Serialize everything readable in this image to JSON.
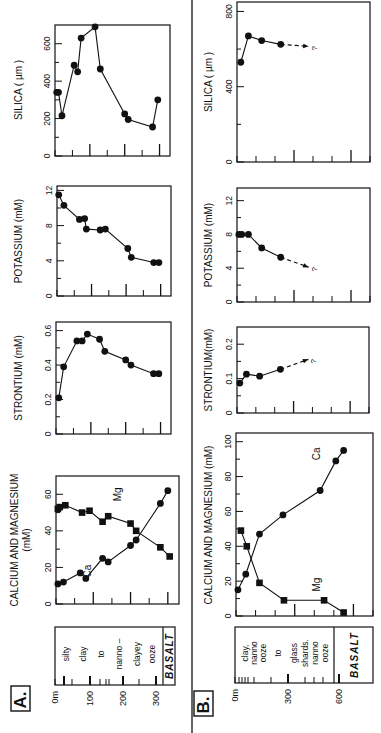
{
  "figure": {
    "panel_a_label": "A.",
    "panel_b_label": "B.",
    "unknown_marker": "?"
  },
  "panel_a": {
    "lithology": {
      "depth_ticks": [
        "0m",
        "100",
        "200",
        "300"
      ],
      "words": [
        "silty",
        "clay",
        "to",
        "nanno –",
        "clayey",
        "ooze"
      ],
      "basalt": "BASALT"
    }
  },
  "panel_b": {
    "lithology": {
      "depth_ticks": [
        "0m",
        "300",
        "600"
      ],
      "words": [
        "clay,",
        "nanno",
        "ooze",
        "to",
        "glass",
        "shards.",
        "nanno",
        "ooze"
      ],
      "basalt": "BASALT"
    }
  },
  "chart_data": [
    {
      "panel": "A",
      "type": "line",
      "title": "SILICA ( µm )",
      "ylabel": "SILICA ( µm )",
      "xlabel": "Depth (m)",
      "ylim": [
        0,
        700
      ],
      "yticks": [
        "0",
        "200",
        "400",
        "600"
      ],
      "xlim": [
        0,
        330
      ],
      "x": [
        5,
        10,
        20,
        55,
        65,
        75,
        115,
        130,
        200,
        210,
        280,
        295
      ],
      "values": [
        340,
        340,
        215,
        485,
        450,
        630,
        690,
        465,
        225,
        195,
        155,
        300
      ]
    },
    {
      "panel": "A",
      "type": "line",
      "title": "POTASSIUM (mM)",
      "ylabel": "POTASSIUM (mM)",
      "xlabel": "Depth (m)",
      "ylim": [
        0,
        12.5
      ],
      "yticks": [
        "0",
        "4",
        "8",
        "12"
      ],
      "xlim": [
        0,
        330
      ],
      "x": [
        5,
        20,
        65,
        80,
        85,
        125,
        140,
        205,
        215,
        280,
        295
      ],
      "values": [
        11.5,
        10.3,
        8.7,
        8.8,
        7.6,
        7.5,
        7.6,
        5.4,
        4.4,
        3.8,
        3.8
      ]
    },
    {
      "panel": "A",
      "type": "line",
      "title": "STRONTIUM (mM)",
      "ylabel": "STRONTIUM (mM)",
      "xlabel": "Depth (m)",
      "ylim": [
        0,
        0.65
      ],
      "yticks": [
        "0",
        "0.2",
        "0.4",
        "0.6"
      ],
      "xlim": [
        0,
        330
      ],
      "x": [
        8,
        22,
        60,
        75,
        90,
        125,
        140,
        200,
        215,
        280,
        295
      ],
      "values": [
        0.21,
        0.39,
        0.54,
        0.54,
        0.58,
        0.55,
        0.48,
        0.43,
        0.4,
        0.35,
        0.35
      ]
    },
    {
      "panel": "A",
      "type": "line",
      "title": "CALCIUM AND MAGNESIUM (mM)",
      "ylabel": "CALCIUM AND MAGNESIUM (mM)",
      "xlabel": "Depth (m)",
      "ylim": [
        0,
        70
      ],
      "yticks": [
        "0",
        "20",
        "40",
        "60"
      ],
      "xlim": [
        0,
        330
      ],
      "series": [
        {
          "name": "Ca",
          "marker": "circle",
          "x": [
            5,
            20,
            65,
            80,
            125,
            140,
            200,
            215,
            280,
            300
          ],
          "values": [
            11,
            12,
            17,
            14,
            25,
            23,
            32,
            35,
            55,
            62
          ]
        },
        {
          "name": "Mg",
          "marker": "square",
          "x": [
            5,
            10,
            25,
            70,
            90,
            125,
            140,
            200,
            215,
            280,
            305
          ],
          "values": [
            52,
            53,
            54,
            50,
            51,
            45,
            48,
            44,
            40,
            31,
            26
          ]
        }
      ]
    },
    {
      "panel": "B",
      "type": "line",
      "title": "SILICA ( µm )",
      "ylabel": "SILICA ( µm )",
      "xlabel": "Depth (m)",
      "ylim": [
        0,
        850
      ],
      "yticks": [
        "0",
        "400",
        "800"
      ],
      "xlim": [
        0,
        700
      ],
      "x": [
        20,
        60,
        130,
        230
      ],
      "values": [
        530,
        670,
        645,
        625
      ],
      "trend": "dashed arrow to ?"
    },
    {
      "panel": "B",
      "type": "line",
      "title": "POTASSIUM (mM)",
      "ylabel": "POTASSIUM (mM)",
      "xlabel": "Depth (m)",
      "ylim": [
        0,
        13.5
      ],
      "yticks": [
        "0",
        "4",
        "8",
        "12"
      ],
      "xlim": [
        0,
        700
      ],
      "x": [
        10,
        25,
        60,
        130,
        230
      ],
      "values": [
        8,
        8,
        8,
        6.4,
        5.3
      ],
      "trend": "dashed arrow to ?"
    },
    {
      "panel": "B",
      "type": "line",
      "title": "STRONTIUM(mM)",
      "ylabel": "STRONTIUM(mM)",
      "xlabel": "Depth (m)",
      "ylim": [
        0,
        0.25
      ],
      "yticks": [
        "0",
        "0.1",
        "0.2"
      ],
      "xlim": [
        0,
        700
      ],
      "x": [
        15,
        50,
        120,
        230
      ],
      "values": [
        0.087,
        0.113,
        0.107,
        0.127
      ],
      "trend": "dashed arrow to ?"
    },
    {
      "panel": "B",
      "type": "line",
      "title": "CALCIUM AND MAGNESIUM (mM)",
      "ylabel": "CALCIUM AND MAGNESIUM (mM)",
      "xlabel": "Depth (m)",
      "ylim": [
        0,
        105
      ],
      "yticks": [
        "0",
        "20",
        "40",
        "60",
        "80",
        "100"
      ],
      "xlim": [
        0,
        700
      ],
      "series": [
        {
          "name": "Ca",
          "marker": "circle",
          "x": [
            10,
            50,
            120,
            240,
            430,
            510,
            550
          ],
          "values": [
            15,
            24,
            47,
            58,
            72,
            89,
            95
          ]
        },
        {
          "name": "Mg",
          "marker": "square",
          "x": [
            25,
            55,
            120,
            245,
            450,
            550
          ],
          "values": [
            49,
            40,
            19,
            9,
            9,
            2
          ]
        }
      ]
    }
  ]
}
